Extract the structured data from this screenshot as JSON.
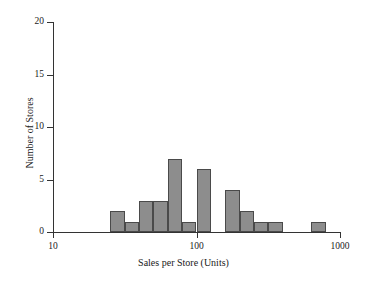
{
  "chart_data": {
    "type": "bar",
    "title": "",
    "subtitle": "",
    "xlabel": "Sales per Store (Units)",
    "ylabel": "Number of Stores",
    "xscale": "log",
    "yscale": "linear",
    "grid": false,
    "legend": null,
    "xlim": [
      10,
      1000
    ],
    "ylim": [
      0,
      20
    ],
    "x_tick_labels": [
      "10",
      "100",
      "1000"
    ],
    "x_tick_values": [
      10,
      100,
      1000
    ],
    "y_tick_labels": [
      "0",
      "5",
      "10",
      "15",
      "20"
    ],
    "y_tick_values": [
      0,
      5,
      10,
      15,
      20
    ],
    "bin_edges": [
      25.1,
      31.6,
      39.8,
      50.1,
      63.1,
      79.4,
      100,
      125.9,
      158.5,
      199.5,
      251.2,
      316.2,
      398.1,
      631,
      794.3
    ],
    "categories": [
      "25-32",
      "32-40",
      "40-50",
      "50-63",
      "63-79",
      "79-100",
      "100-126",
      "126-158",
      "158-200",
      "200-251",
      "251-316",
      "316-398",
      "398-631",
      "631-794"
    ],
    "values": [
      2,
      1,
      3,
      3,
      7,
      1,
      6,
      0,
      4,
      2,
      1,
      1,
      0,
      1
    ],
    "bar_color": "#8d8d8d",
    "bar_edge_color": "#4a4a4a",
    "axis_color": "#333333"
  }
}
